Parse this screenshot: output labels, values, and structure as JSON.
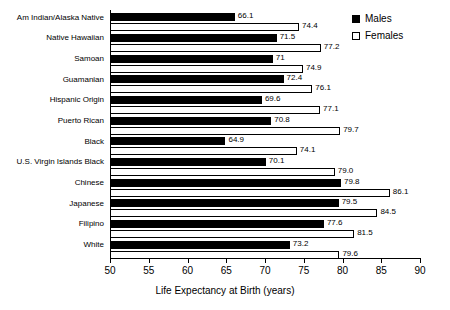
{
  "chart_data": {
    "type": "bar",
    "orientation": "horizontal",
    "title": "",
    "xlabel": "Life Expectancy at Birth (years)",
    "ylabel": "",
    "xlim": [
      50,
      90
    ],
    "xticks": [
      50,
      55,
      60,
      65,
      70,
      75,
      80,
      85,
      90
    ],
    "grid": false,
    "legend_position": "top-right",
    "categories": [
      "Am Indian/Alaska Native",
      "Native Hawaiian",
      "Samoan",
      "Guamanian",
      "Hispanic Origin",
      "Puerto Rican",
      "Black",
      "U.S. Virgin Islands Black",
      "Chinese",
      "Japanese",
      "Filipino",
      "White"
    ],
    "series": [
      {
        "name": "Males",
        "color": "#000000",
        "style": "filled",
        "values": [
          66.1,
          71.5,
          71,
          72.4,
          69.6,
          70.8,
          64.9,
          70.1,
          79.8,
          79.5,
          77.6,
          73.2
        ],
        "labels": [
          "66.1",
          "71.5",
          "71",
          "72.4",
          "69.6",
          "70.8",
          "64.9",
          "70.1",
          "79.8",
          "79.5",
          "77.6",
          "73.2"
        ]
      },
      {
        "name": "Females",
        "color": "#ffffff",
        "style": "hollow",
        "values": [
          74.4,
          77.2,
          74.9,
          76.1,
          77.1,
          79.7,
          74.1,
          79.0,
          86.1,
          84.5,
          81.5,
          79.6
        ],
        "labels": [
          "74.4",
          "77.2",
          "74.9",
          "76.1",
          "77.1",
          "79.7",
          "74.1",
          "79.0",
          "86.1",
          "84.5",
          "81.5",
          "79.6"
        ]
      }
    ]
  },
  "legend": {
    "items": [
      {
        "label": "Males",
        "swatch": "filled-square"
      },
      {
        "label": "Females",
        "swatch": "hollow-square"
      }
    ]
  }
}
